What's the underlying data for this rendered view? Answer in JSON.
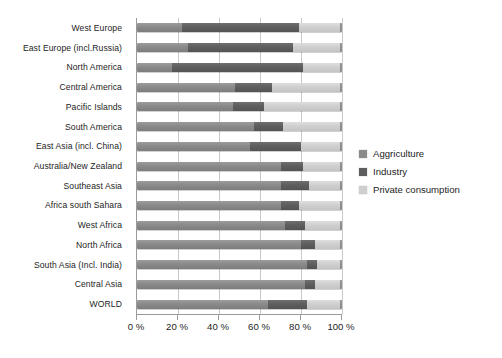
{
  "chart_data": {
    "type": "bar",
    "orientation": "horizontal",
    "stacked": true,
    "normalized": true,
    "title": "",
    "xlabel": "",
    "ylabel": "",
    "xlim": [
      0,
      100
    ],
    "xticks": [
      0,
      20,
      40,
      60,
      80,
      100
    ],
    "xticklabels": [
      "0 %",
      "20 %",
      "40 %",
      "60 %",
      "80 %",
      "100 %"
    ],
    "grid": "vertical",
    "legend_position": "right",
    "categories": [
      "West Europe",
      "East Europe (incl.Russia)",
      "North America",
      "Central America",
      "Pacific Islands",
      "South America",
      "East Asia (incl. China)",
      "Australia/New Zealand",
      "Southeast Asia",
      "Africa south Sahara",
      "West Africa",
      "North Africa",
      "South Asia (Incl. India)",
      "Central Asia",
      "WORLD"
    ],
    "series": [
      {
        "name": "Aggriculture",
        "color": "#8a8a8a",
        "values": [
          22,
          25,
          17,
          48,
          47,
          57,
          55,
          70,
          70,
          70,
          72,
          80,
          83,
          82,
          64
        ]
      },
      {
        "name": "Industry",
        "color": "#5e5e5e",
        "values": [
          57,
          51,
          64,
          18,
          15,
          14,
          25,
          11,
          14,
          9,
          10,
          7,
          5,
          5,
          19
        ]
      },
      {
        "name": "Private consumption",
        "color": "#cfcfcf",
        "values": [
          21,
          24,
          19,
          34,
          38,
          29,
          20,
          19,
          16,
          21,
          18,
          13,
          12,
          13,
          17
        ]
      }
    ]
  },
  "legend": {
    "items": [
      {
        "label": "Aggriculture",
        "color": "#8a8a8a"
      },
      {
        "label": "Industry",
        "color": "#5e5e5e"
      },
      {
        "label": "Private consumption",
        "color": "#cfcfcf"
      }
    ]
  }
}
